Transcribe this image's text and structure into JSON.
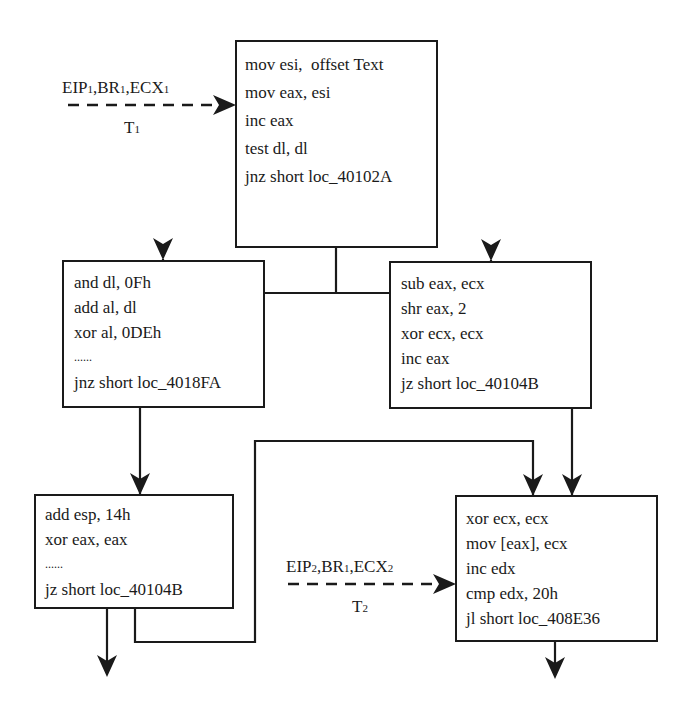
{
  "diagram": {
    "type": "control-flow-graph",
    "colors": {
      "stroke": "#1a1a1a",
      "background": "#ffffff"
    },
    "blocks": [
      {
        "id": "top",
        "lines": [
          "mov esi,  offset Text",
          "mov eax, esi",
          "inc eax",
          "test dl, dl",
          "jnz short loc_40102A"
        ]
      },
      {
        "id": "mid_left",
        "lines": [
          "and dl, 0Fh",
          "add al, dl",
          "xor al, 0DEh",
          "......",
          "jnz short loc_4018FA"
        ]
      },
      {
        "id": "mid_right",
        "lines": [
          "sub eax, ecx",
          "shr eax, 2",
          "xor ecx, ecx",
          "inc eax",
          "jz short loc_40104B"
        ]
      },
      {
        "id": "bot_left",
        "lines": [
          "add esp, 14h",
          "xor eax, eax",
          "......",
          "jz short loc_40104B"
        ]
      },
      {
        "id": "bot_right",
        "lines": [
          "xor ecx, ecx",
          "mov [eax], ecx",
          "inc edx",
          "cmp edx, 20h",
          "jl short loc_408E36"
        ]
      }
    ],
    "threads": [
      {
        "id": "t1",
        "state": {
          "eip": "EIP",
          "eip_sub": "1",
          "br": "BR",
          "br_sub": "1",
          "ecx": "ECX",
          "ecx_sub": "1"
        },
        "name": "T",
        "name_sub": "1",
        "target": "top"
      },
      {
        "id": "t2",
        "state": {
          "eip": "EIP",
          "eip_sub": "2",
          "br": "BR",
          "br_sub": "1",
          "ecx": "ECX",
          "ecx_sub": "2"
        },
        "name": "T",
        "name_sub": "2",
        "target": "bot_right"
      }
    ]
  }
}
